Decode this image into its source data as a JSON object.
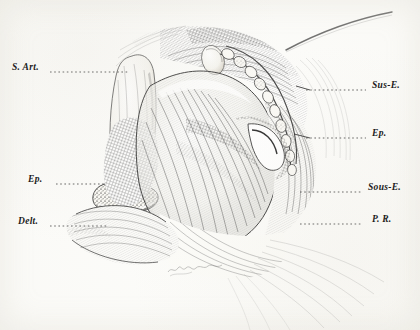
{
  "figure": {
    "medium": "pen-and-ink engraving",
    "signature": "A. Mignot",
    "paper_color": "#fdfdfb",
    "ink_color": "#1b1b1b"
  },
  "labels": {
    "left": [
      {
        "id": "s-art",
        "text": "S. Art.",
        "x": 12,
        "y": 68,
        "leader_to_x": 128,
        "leader_y": 72
      },
      {
        "id": "ep-left",
        "text": "Ep.",
        "x": 26,
        "y": 180,
        "leader_to_x": 104,
        "leader_y": 184
      },
      {
        "id": "delt",
        "text": "Delt.",
        "x": 18,
        "y": 222,
        "leader_to_x": 108,
        "leader_y": 226
      }
    ],
    "right": [
      {
        "id": "sus-e",
        "text": "Sus-E.",
        "x": 372,
        "y": 88,
        "leader_to_x": 306,
        "leader_y": 90
      },
      {
        "id": "ep-right",
        "text": "Ep.",
        "x": 372,
        "y": 136,
        "leader_to_x": 306,
        "leader_y": 138
      },
      {
        "id": "sous-e",
        "text": "Sous-E.",
        "x": 368,
        "y": 190,
        "leader_to_x": 300,
        "leader_y": 192
      },
      {
        "id": "p-r",
        "text": "P. R.",
        "x": 372,
        "y": 222,
        "leader_to_x": 300,
        "leader_y": 224
      }
    ]
  }
}
